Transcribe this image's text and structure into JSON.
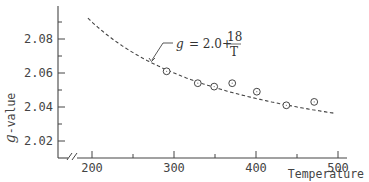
{
  "chart_data": {
    "type": "scatter",
    "title": "",
    "xlabel": "Temperature",
    "ylabel": "g-value",
    "xlim": [
      165,
      515
    ],
    "ylim": [
      2.01,
      2.097
    ],
    "x_ticks": [
      200,
      300,
      400,
      500
    ],
    "x_tick_labels": [
      "200",
      "300",
      "400",
      "500"
    ],
    "y_ticks": [
      2.02,
      2.04,
      2.06,
      2.08
    ],
    "y_tick_labels": [
      "2.02",
      "2.04",
      "2.06",
      "2.08"
    ],
    "grid": false,
    "axis_break_x": true,
    "series": [
      {
        "name": "measured",
        "marker": "circle-open",
        "x": [
          291,
          329,
          349,
          371,
          401,
          437,
          471
        ],
        "y": [
          2.061,
          2.054,
          2.052,
          2.054,
          2.049,
          2.041,
          2.043
        ]
      },
      {
        "name": "g = 2.0 + 18/T",
        "style": "dashed",
        "formula": "g = 2.0 + 18/T",
        "x_range": [
          195,
          495
        ]
      }
    ],
    "annotations": [
      {
        "text_prefix": "g",
        "text_main": "= 2.0+",
        "numerator": "18",
        "denominator": "T",
        "arrow_target": [
          270,
          2.0667
        ]
      }
    ]
  },
  "labels": {
    "xlabel": "Temperature",
    "ylabel_symbol": "g",
    "ylabel_rest": "-value",
    "eq_symbol": "g",
    "eq_main": "= 2.0+",
    "eq_num": "18",
    "eq_den": "T"
  }
}
